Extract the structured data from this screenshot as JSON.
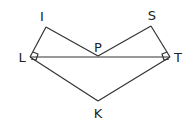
{
  "diagram": {
    "type": "geometry",
    "stroke_color": "#333333",
    "points": {
      "I": {
        "label": "I",
        "x": 46,
        "y": 27
      },
      "S": {
        "label": "S",
        "x": 151,
        "y": 26
      },
      "L": {
        "label": "L",
        "x": 30,
        "y": 57
      },
      "P": {
        "label": "P",
        "x": 98,
        "y": 56
      },
      "T": {
        "label": "T",
        "x": 170,
        "y": 57
      },
      "K": {
        "label": "K",
        "x": 98,
        "y": 101
      }
    },
    "segments": [
      "LI",
      "IP",
      "PS",
      "ST",
      "LT",
      "LK",
      "KT"
    ],
    "right_angles": [
      "L",
      "T"
    ],
    "labels": {
      "I": "I",
      "S": "S",
      "L": "L",
      "P": "P",
      "T": "T",
      "K": "K"
    }
  }
}
